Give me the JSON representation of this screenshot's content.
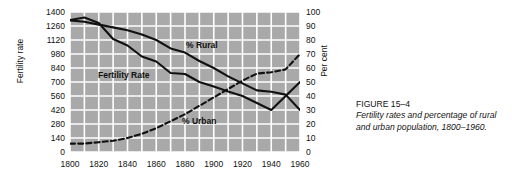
{
  "caption": {
    "title": "FIGURE 15–4",
    "body": "Fertility rates and percentage of rural and urban population, 1800–1960."
  },
  "axes": {
    "left_title": "Fertility rate",
    "right_title": "Per cent",
    "left_ticks": [
      "1400",
      "1260",
      "1120",
      "980",
      "840",
      "700",
      "560",
      "420",
      "280",
      "140",
      "0"
    ],
    "right_ticks": [
      "100",
      "90",
      "80",
      "70",
      "60",
      "50",
      "40",
      "30",
      "20",
      "10",
      "0"
    ],
    "x_ticks": [
      "1800",
      "1820",
      "1840",
      "1860",
      "1880",
      "1900",
      "1920",
      "1940",
      "1960"
    ]
  },
  "series_labels": {
    "rural": "% Rural",
    "fertility": "Fertility Rate",
    "urban": "% Urban"
  },
  "colors": {
    "plot_background": "#a9a9a9",
    "gridline": "#ffffff",
    "line": "#111111",
    "page_background": "#ffffff"
  },
  "chart_data": {
    "type": "line",
    "title": "Fertility rates and percentage of rural and urban population, 1800–1960",
    "xlabel": "",
    "ylabel": "Fertility rate",
    "y2label": "Per cent",
    "xlim": [
      1800,
      1960
    ],
    "ylim": [
      0,
      1400
    ],
    "y2lim": [
      0,
      100
    ],
    "grid": true,
    "legend": "inline-labels",
    "x": [
      1800,
      1810,
      1820,
      1830,
      1840,
      1850,
      1860,
      1870,
      1880,
      1890,
      1900,
      1910,
      1920,
      1930,
      1940,
      1950,
      1960
    ],
    "series": [
      {
        "name": "Fertility Rate",
        "axis": "left",
        "style": "solid",
        "units": "births per 1,000 women aged 15-44 (scaled)",
        "values": [
          1320,
          1345,
          1290,
          1130,
          1065,
          955,
          905,
          790,
          780,
          700,
          655,
          605,
          560,
          490,
          420,
          560,
          700
        ]
      },
      {
        "name": "% Rural",
        "axis": "right",
        "style": "solid",
        "units": "per cent",
        "values": [
          94,
          93,
          91,
          89,
          87,
          84,
          80,
          74,
          71,
          65,
          60,
          54,
          49,
          44,
          43,
          41,
          30
        ]
      },
      {
        "name": "% Urban",
        "axis": "right",
        "style": "dashed",
        "units": "per cent",
        "values": [
          6,
          6,
          7,
          8,
          10,
          13,
          17,
          22,
          27,
          33,
          39,
          45,
          51,
          56,
          57,
          59,
          70
        ]
      }
    ]
  }
}
